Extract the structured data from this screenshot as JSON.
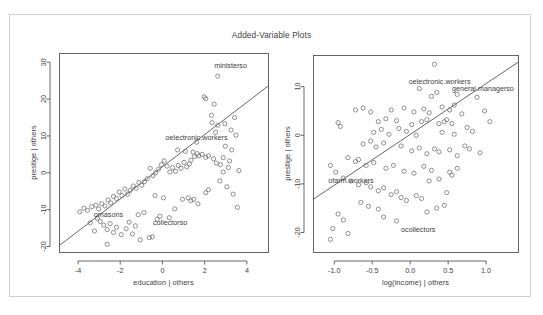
{
  "figure": {
    "title": "Added-Variable Plots",
    "background_color": "#ffffff",
    "frame_color": "#cfcfcf",
    "axis_color": "#555555",
    "point_color": "#6b6b6b",
    "line_color": "#555555"
  },
  "chart_data": [
    {
      "type": "scatter",
      "panel": "left",
      "title": "",
      "xlabel": "education | others",
      "ylabel": "prestige | others",
      "xlim": [
        -4.9,
        5.0
      ],
      "ylim": [
        -21.5,
        32.5
      ],
      "xticks": [
        -4,
        -2,
        0,
        2,
        4
      ],
      "xticklabels": [
        "-4",
        "-2",
        "0",
        "2",
        "4"
      ],
      "yticks": [
        -20,
        -10,
        0,
        10,
        20,
        30
      ],
      "yticklabels": [
        "-20",
        "-10",
        "0",
        "10",
        "20",
        "30"
      ],
      "grid": false,
      "legend": "none",
      "regression_line": {
        "x": [
          -4.9,
          5.0
        ],
        "y": [
          -19.8,
          23.5
        ]
      },
      "annotations": [
        {
          "text": "ministerso",
          "x": 2.45,
          "y": 29.0
        },
        {
          "text": "oelectronic.workers",
          "x": 0.15,
          "y": 9.7
        },
        {
          "text": "omasons",
          "x": -3.25,
          "y": -11.3
        },
        {
          "text": "collectorso",
          "x": -0.45,
          "y": -13.5
        }
      ],
      "points": [
        {
          "x": 2.62,
          "y": 26.2
        },
        {
          "x": 1.98,
          "y": 20.6
        },
        {
          "x": 2.05,
          "y": 20.1
        },
        {
          "x": 2.45,
          "y": 18.6
        },
        {
          "x": 2.32,
          "y": 15.6
        },
        {
          "x": 2.35,
          "y": 13.6
        },
        {
          "x": 2.62,
          "y": 12.9
        },
        {
          "x": 2.95,
          "y": 13.3
        },
        {
          "x": 2.52,
          "y": 11.0
        },
        {
          "x": 1.62,
          "y": 8.3
        },
        {
          "x": 2.98,
          "y": 7.2
        },
        {
          "x": 3.28,
          "y": 6.2
        },
        {
          "x": 2.88,
          "y": 4.1
        },
        {
          "x": 3.18,
          "y": 3.2
        },
        {
          "x": 2.75,
          "y": 2.2
        },
        {
          "x": 2.55,
          "y": 2.6
        },
        {
          "x": 2.42,
          "y": 3.8
        },
        {
          "x": 2.18,
          "y": 4.6
        },
        {
          "x": 2.05,
          "y": 4.2
        },
        {
          "x": 1.88,
          "y": 5.0
        },
        {
          "x": 1.72,
          "y": 4.6
        },
        {
          "x": 1.65,
          "y": 5.2
        },
        {
          "x": 1.52,
          "y": 4.4
        },
        {
          "x": 1.45,
          "y": 5.6
        },
        {
          "x": 1.35,
          "y": 3.4
        },
        {
          "x": 1.28,
          "y": 2.4
        },
        {
          "x": 1.15,
          "y": 1.6
        },
        {
          "x": 1.02,
          "y": 2.8
        },
        {
          "x": 0.88,
          "y": 1.2
        },
        {
          "x": 0.75,
          "y": 2.0
        },
        {
          "x": 0.62,
          "y": 0.4
        },
        {
          "x": 0.48,
          "y": 1.4
        },
        {
          "x": 0.35,
          "y": 0.2
        },
        {
          "x": 0.22,
          "y": 1.8
        },
        {
          "x": 0.08,
          "y": 3.2
        },
        {
          "x": -0.05,
          "y": 2.2
        },
        {
          "x": -0.18,
          "y": 1.0
        },
        {
          "x": -0.32,
          "y": 0.0
        },
        {
          "x": -0.45,
          "y": -0.8
        },
        {
          "x": -0.58,
          "y": 1.2
        },
        {
          "x": -0.72,
          "y": -1.6
        },
        {
          "x": -0.85,
          "y": -2.4
        },
        {
          "x": -0.98,
          "y": -3.4
        },
        {
          "x": -1.12,
          "y": -2.6
        },
        {
          "x": -1.25,
          "y": -4.2
        },
        {
          "x": -1.38,
          "y": -3.6
        },
        {
          "x": -1.52,
          "y": -4.8
        },
        {
          "x": -1.65,
          "y": -5.8
        },
        {
          "x": -1.78,
          "y": -4.4
        },
        {
          "x": -1.92,
          "y": -6.2
        },
        {
          "x": -2.05,
          "y": -5.2
        },
        {
          "x": -2.18,
          "y": -7.0
        },
        {
          "x": -2.32,
          "y": -6.4
        },
        {
          "x": -2.45,
          "y": -8.2
        },
        {
          "x": -2.58,
          "y": -7.4
        },
        {
          "x": -2.72,
          "y": -9.0
        },
        {
          "x": -2.88,
          "y": -8.4
        },
        {
          "x": -3.02,
          "y": -9.8
        },
        {
          "x": -3.15,
          "y": -8.8
        },
        {
          "x": -3.35,
          "y": -9.2
        },
        {
          "x": -3.55,
          "y": -10.2
        },
        {
          "x": -3.72,
          "y": -9.6
        },
        {
          "x": -3.92,
          "y": -10.6
        },
        {
          "x": -2.95,
          "y": -13.2
        },
        {
          "x": -2.78,
          "y": -14.2
        },
        {
          "x": -2.62,
          "y": -15.4
        },
        {
          "x": -2.48,
          "y": -13.8
        },
        {
          "x": -2.32,
          "y": -16.2
        },
        {
          "x": -2.18,
          "y": -14.8
        },
        {
          "x": -3.08,
          "y": -12.4
        },
        {
          "x": -3.22,
          "y": -15.8
        },
        {
          "x": -3.42,
          "y": -13.6
        },
        {
          "x": -1.95,
          "y": -16.8
        },
        {
          "x": -1.72,
          "y": -15.2
        },
        {
          "x": -1.58,
          "y": -13.4
        },
        {
          "x": -1.42,
          "y": -16.6
        },
        {
          "x": -1.28,
          "y": -14.4
        },
        {
          "x": -2.62,
          "y": -19.4
        },
        {
          "x": -1.05,
          "y": -18.2
        },
        {
          "x": -0.62,
          "y": -17.6
        },
        {
          "x": -0.48,
          "y": -17.4
        },
        {
          "x": -0.25,
          "y": -12.6
        },
        {
          "x": -0.12,
          "y": -11.8
        },
        {
          "x": 0.95,
          "y": -7.2
        },
        {
          "x": 1.22,
          "y": -6.8
        },
        {
          "x": 1.35,
          "y": -7.6
        },
        {
          "x": 1.48,
          "y": -7.2
        },
        {
          "x": 1.68,
          "y": -8.4
        },
        {
          "x": 0.58,
          "y": -9.8
        },
        {
          "x": 0.32,
          "y": -12.2
        },
        {
          "x": 2.72,
          "y": -2.2
        },
        {
          "x": 3.05,
          "y": -3.8
        },
        {
          "x": 3.35,
          "y": -5.8
        },
        {
          "x": 3.55,
          "y": -9.4
        },
        {
          "x": 3.62,
          "y": 0.6
        },
        {
          "x": 3.48,
          "y": 10.2
        },
        {
          "x": 3.25,
          "y": 11.6
        },
        {
          "x": 3.42,
          "y": 15.0
        },
        {
          "x": 2.18,
          "y": -4.6
        },
        {
          "x": 2.05,
          "y": -5.4
        },
        {
          "x": 0.05,
          "y": -6.8
        },
        {
          "x": -0.35,
          "y": -6.2
        },
        {
          "x": 2.88,
          "y": 0.2
        },
        {
          "x": 3.12,
          "y": 1.4
        },
        {
          "x": 0.72,
          "y": 6.2
        },
        {
          "x": 1.08,
          "y": 5.8
        },
        {
          "x": -0.88,
          "y": -10.8
        },
        {
          "x": -1.15,
          "y": -11.4
        }
      ]
    },
    {
      "type": "scatter",
      "panel": "right",
      "title": "",
      "xlabel": "log(income) | others",
      "ylabel": "prestige | others",
      "xlim": [
        -1.28,
        1.42
      ],
      "ylim": [
        -24.0,
        16.5
      ],
      "xticks": [
        -1.0,
        -0.5,
        0.0,
        0.5,
        1.0
      ],
      "xticklabels": [
        "-1.0",
        "-0.5",
        "0.0",
        "0.5",
        "1.0"
      ],
      "yticks": [
        -20,
        -10,
        0,
        10
      ],
      "yticklabels": [
        "-20",
        "-10",
        "0",
        "10"
      ],
      "grid": false,
      "legend": "none",
      "regression_line": {
        "x": [
          -1.28,
          1.42
        ],
        "y": [
          -13.2,
          15.0
        ]
      },
      "annotations": [
        {
          "text": "oelectronic.workers",
          "x": -0.02,
          "y": 11.0
        },
        {
          "text": "general.managerso",
          "x": 0.55,
          "y": 9.6
        },
        {
          "text": "ofarm.workers",
          "x": -1.08,
          "y": -9.3
        },
        {
          "text": "ocollectors",
          "x": -0.12,
          "y": -19.4
        }
      ],
      "points": [
        {
          "x": 0.32,
          "y": 14.6
        },
        {
          "x": 0.12,
          "y": 9.6
        },
        {
          "x": 0.35,
          "y": 8.8
        },
        {
          "x": 0.28,
          "y": 8.0
        },
        {
          "x": 0.62,
          "y": 8.4
        },
        {
          "x": 0.88,
          "y": 7.8
        },
        {
          "x": -0.72,
          "y": 5.2
        },
        {
          "x": -0.62,
          "y": 5.6
        },
        {
          "x": -0.52,
          "y": 4.8
        },
        {
          "x": -0.25,
          "y": 5.2
        },
        {
          "x": -0.08,
          "y": 5.6
        },
        {
          "x": 0.05,
          "y": 4.8
        },
        {
          "x": 0.18,
          "y": 5.4
        },
        {
          "x": 0.25,
          "y": 4.6
        },
        {
          "x": 0.42,
          "y": 5.8
        },
        {
          "x": 0.52,
          "y": 5.2
        },
        {
          "x": 0.58,
          "y": 6.2
        },
        {
          "x": 0.68,
          "y": 4.4
        },
        {
          "x": -0.95,
          "y": 2.6
        },
        {
          "x": -0.42,
          "y": 2.8
        },
        {
          "x": -0.32,
          "y": 3.4
        },
        {
          "x": -0.18,
          "y": 3.0
        },
        {
          "x": 0.02,
          "y": 2.2
        },
        {
          "x": 0.15,
          "y": 2.8
        },
        {
          "x": 0.22,
          "y": 3.2
        },
        {
          "x": 0.38,
          "y": 2.4
        },
        {
          "x": 0.45,
          "y": 2.8
        },
        {
          "x": 0.48,
          "y": 3.2
        },
        {
          "x": 0.55,
          "y": 2.4
        },
        {
          "x": 0.75,
          "y": 1.6
        },
        {
          "x": -0.48,
          "y": 0.6
        },
        {
          "x": -0.38,
          "y": 1.2
        },
        {
          "x": -0.28,
          "y": 0.2
        },
        {
          "x": -0.15,
          "y": 1.4
        },
        {
          "x": -0.05,
          "y": 0.8
        },
        {
          "x": 0.08,
          "y": 0.0
        },
        {
          "x": 0.42,
          "y": 0.6
        },
        {
          "x": 0.58,
          "y": 0.2
        },
        {
          "x": 0.82,
          "y": 0.8
        },
        {
          "x": -0.62,
          "y": -1.8
        },
        {
          "x": -0.52,
          "y": -1.2
        },
        {
          "x": -0.45,
          "y": -2.4
        },
        {
          "x": -0.35,
          "y": -1.6
        },
        {
          "x": -0.12,
          "y": -2.2
        },
        {
          "x": 0.02,
          "y": -3.2
        },
        {
          "x": 0.12,
          "y": -2.6
        },
        {
          "x": 0.22,
          "y": -3.8
        },
        {
          "x": 0.32,
          "y": -2.8
        },
        {
          "x": 0.38,
          "y": -3.4
        },
        {
          "x": 0.52,
          "y": -3.0
        },
        {
          "x": 0.62,
          "y": -4.2
        },
        {
          "x": 0.92,
          "y": -3.6
        },
        {
          "x": -0.82,
          "y": -4.6
        },
        {
          "x": -0.72,
          "y": -5.4
        },
        {
          "x": -0.68,
          "y": -5.0
        },
        {
          "x": -0.58,
          "y": -6.2
        },
        {
          "x": -0.48,
          "y": -5.6
        },
        {
          "x": -0.32,
          "y": -6.8
        },
        {
          "x": -0.22,
          "y": -6.2
        },
        {
          "x": -0.08,
          "y": -7.4
        },
        {
          "x": 0.05,
          "y": -7.8
        },
        {
          "x": 0.18,
          "y": -6.4
        },
        {
          "x": 0.28,
          "y": -7.2
        },
        {
          "x": -1.05,
          "y": -6.2
        },
        {
          "x": -0.98,
          "y": -7.6
        },
        {
          "x": -0.88,
          "y": -8.8
        },
        {
          "x": -0.78,
          "y": -9.4
        },
        {
          "x": -0.68,
          "y": -10.2
        },
        {
          "x": -0.58,
          "y": -9.8
        },
        {
          "x": -0.52,
          "y": -10.6
        },
        {
          "x": -0.42,
          "y": -11.4
        },
        {
          "x": -0.35,
          "y": -10.8
        },
        {
          "x": -0.25,
          "y": -12.2
        },
        {
          "x": -0.18,
          "y": -11.6
        },
        {
          "x": -0.12,
          "y": -12.8
        },
        {
          "x": -0.05,
          "y": -13.4
        },
        {
          "x": 0.08,
          "y": -12.4
        },
        {
          "x": 0.15,
          "y": -13.0
        },
        {
          "x": -0.65,
          "y": -13.8
        },
        {
          "x": -0.55,
          "y": -14.6
        },
        {
          "x": -0.95,
          "y": -16.2
        },
        {
          "x": -0.88,
          "y": -17.4
        },
        {
          "x": -1.02,
          "y": -19.2
        },
        {
          "x": -1.05,
          "y": -21.4
        },
        {
          "x": -0.82,
          "y": -20.2
        },
        {
          "x": -0.35,
          "y": -16.8
        },
        {
          "x": -0.18,
          "y": -17.6
        },
        {
          "x": -0.42,
          "y": -15.2
        },
        {
          "x": 0.72,
          "y": -2.2
        },
        {
          "x": 0.78,
          "y": -2.8
        },
        {
          "x": 0.62,
          "y": -6.8
        },
        {
          "x": 0.52,
          "y": -7.6
        },
        {
          "x": 0.55,
          "y": -8.2
        },
        {
          "x": 0.25,
          "y": -9.4
        },
        {
          "x": 0.38,
          "y": -9.0
        },
        {
          "x": 0.48,
          "y": -11.8
        },
        {
          "x": -0.92,
          "y": 1.8
        },
        {
          "x": 0.98,
          "y": 5.0
        },
        {
          "x": 1.05,
          "y": 2.8
        },
        {
          "x": 0.45,
          "y": -14.4
        },
        {
          "x": 0.35,
          "y": -15.0
        },
        {
          "x": 0.22,
          "y": -15.8
        }
      ]
    }
  ]
}
